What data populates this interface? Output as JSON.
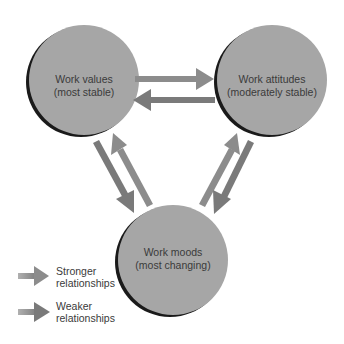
{
  "nodes": {
    "values": {
      "line1": "Work values",
      "line2": "(most stable)"
    },
    "attitudes": {
      "line1": "Work attitudes",
      "line2": "(moderately stable)"
    },
    "moods": {
      "line1": "Work moods",
      "line2": "(most changing)"
    }
  },
  "legend": {
    "stronger": {
      "line1": "Stronger",
      "line2": "relationships"
    },
    "weaker": {
      "line1": "Weaker",
      "line2": "relationships"
    }
  },
  "colors": {
    "circle_fill": "#a6a6a6",
    "circle_shadow": "#1a1a1a",
    "stronger_arrow": "#8c8c8c",
    "weaker_arrow": "#7a7a7a",
    "text": "#3a3a3a"
  }
}
